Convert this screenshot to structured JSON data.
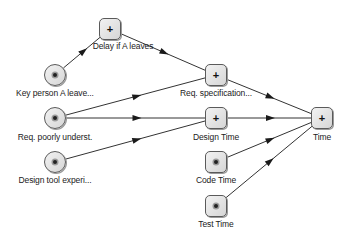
{
  "diagram": {
    "colors": {
      "edge": "#333333",
      "node_border": "#5a5a5a",
      "node_fill": "#e4e4e4"
    },
    "nodes": [
      {
        "id": "delay",
        "label": "Delay if A leaves",
        "shape": "square",
        "icon": "plus",
        "x": 110,
        "y": 29,
        "lx": 123,
        "ly": 41
      },
      {
        "id": "keyperson",
        "label": "Key person A leave...",
        "shape": "circle",
        "icon": "dot",
        "x": 55,
        "y": 75,
        "lx": 55,
        "ly": 88
      },
      {
        "id": "reqpoor",
        "label": "Req. poorly underst.",
        "shape": "circle",
        "icon": "dot",
        "x": 55,
        "y": 118,
        "lx": 55,
        "ly": 132
      },
      {
        "id": "designtool",
        "label": "Design tool experi...",
        "shape": "circle",
        "icon": "dot",
        "x": 55,
        "y": 162,
        "lx": 55,
        "ly": 175
      },
      {
        "id": "reqspec",
        "label": "Req. specification...",
        "shape": "square",
        "icon": "plus",
        "x": 216,
        "y": 75,
        "lx": 216,
        "ly": 88
      },
      {
        "id": "designtime",
        "label": "Design Time",
        "shape": "square",
        "icon": "plus",
        "x": 216,
        "y": 118,
        "lx": 216,
        "ly": 132
      },
      {
        "id": "codetime",
        "label": "Code Time",
        "shape": "square",
        "icon": "dot",
        "x": 216,
        "y": 162,
        "lx": 216,
        "ly": 175
      },
      {
        "id": "testtime",
        "label": "Test Time",
        "shape": "square",
        "icon": "dot",
        "x": 216,
        "y": 206,
        "lx": 216,
        "ly": 219
      },
      {
        "id": "time",
        "label": "Time",
        "shape": "square",
        "icon": "plus",
        "x": 322,
        "y": 118,
        "lx": 322,
        "ly": 132
      }
    ],
    "edges": [
      {
        "from": "keyperson",
        "to": "delay"
      },
      {
        "from": "delay",
        "to": "reqspec"
      },
      {
        "from": "reqpoor",
        "to": "reqspec"
      },
      {
        "from": "reqpoor",
        "to": "designtime"
      },
      {
        "from": "designtool",
        "to": "designtime"
      },
      {
        "from": "reqspec",
        "to": "time"
      },
      {
        "from": "designtime",
        "to": "time"
      },
      {
        "from": "codetime",
        "to": "time"
      },
      {
        "from": "testtime",
        "to": "time"
      }
    ]
  }
}
